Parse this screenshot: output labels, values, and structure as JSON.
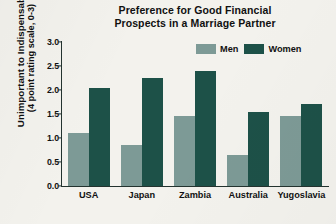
{
  "chart_data": {
    "type": "bar",
    "title": "Preference for Good Financial Prospects in a Marriage Partner",
    "title_line1": "Preference for Good Financial",
    "title_line2": "Prospects in a Marriage Partner",
    "categories": [
      "USA",
      "Japan",
      "Zambia",
      "Australia",
      "Yugoslavia"
    ],
    "series": [
      {
        "name": "Men",
        "color": "#7d9a96",
        "values": [
          1.1,
          0.85,
          1.45,
          0.65,
          1.45
        ]
      },
      {
        "name": "Women",
        "color": "#1d5148",
        "values": [
          2.05,
          2.25,
          2.4,
          1.55,
          1.7
        ]
      }
    ],
    "xlabel": "",
    "ylabel": "Unimportant to Indispensable (4 point rating scale, 0-3)",
    "ylabel_line1": "Unimportant to Indispensable",
    "ylabel_line2": "(4 point rating scale, 0-3)",
    "ylim": [
      0,
      3
    ],
    "ytick_labels": [
      "3.0",
      "2.5",
      "2.0",
      "1.5",
      "1.0",
      "0.5",
      "0.0"
    ],
    "ytick_values": [
      3.0,
      2.5,
      2.0,
      1.5,
      1.0,
      0.5,
      0.0
    ],
    "grid": false,
    "legend_position": "top-right",
    "background_color": "#f3f2ed"
  }
}
